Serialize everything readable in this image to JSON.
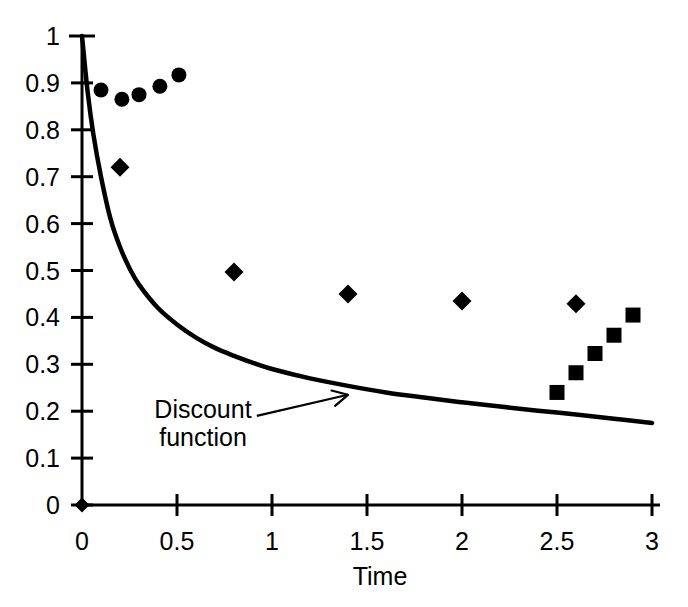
{
  "chart_data": {
    "type": "scatter",
    "title": "",
    "subtitle": "",
    "xlabel": "Time",
    "ylabel": "",
    "xlim": [
      0,
      3
    ],
    "ylim": [
      0,
      1
    ],
    "grid": false,
    "legend_position": "none",
    "x_ticks": [
      0,
      0.5,
      1,
      1.5,
      2,
      2.5,
      3
    ],
    "x_tick_labels": [
      "0",
      "0.5",
      "1",
      "1.5",
      "2",
      "2.5",
      "3"
    ],
    "y_ticks": [
      0,
      0.1,
      0.2,
      0.3,
      0.4,
      0.5,
      0.6,
      0.7,
      0.8,
      0.9,
      1
    ],
    "y_tick_labels": [
      "0",
      "0.1",
      "0.2",
      "0.3",
      "0.4",
      "0.5",
      "0.6",
      "0.7",
      "0.8",
      "0.9",
      "1"
    ],
    "annotations": [
      {
        "text_line1": "Discount",
        "text_line2": "function",
        "text": "Discount function",
        "arrow_from": [
          0.92,
          0.19
        ],
        "arrow_to": [
          1.4,
          0.235
        ]
      }
    ],
    "series": [
      {
        "name": "discount-curve",
        "marker": "line",
        "type": "line",
        "x": [
          0.0,
          0.03,
          0.06,
          0.1,
          0.15,
          0.2,
          0.25,
          0.3,
          0.4,
          0.5,
          0.6,
          0.7,
          0.8,
          0.9,
          1.0,
          1.2,
          1.4,
          1.6,
          1.8,
          2.0,
          2.2,
          2.4,
          2.6,
          2.8,
          3.0
        ],
        "y": [
          1.0,
          0.88,
          0.79,
          0.7,
          0.61,
          0.55,
          0.505,
          0.47,
          0.42,
          0.385,
          0.357,
          0.335,
          0.318,
          0.303,
          0.29,
          0.27,
          0.254,
          0.24,
          0.229,
          0.219,
          0.21,
          0.201,
          0.193,
          0.184,
          0.175
        ]
      },
      {
        "name": "circles",
        "marker": "circle",
        "type": "scatter",
        "x": [
          0.1,
          0.21,
          0.3,
          0.41,
          0.51
        ],
        "y": [
          0.885,
          0.865,
          0.875,
          0.893,
          0.917
        ]
      },
      {
        "name": "diamonds",
        "marker": "diamond",
        "type": "scatter",
        "x": [
          0.2,
          0.8,
          1.4,
          2.0,
          2.6
        ],
        "y": [
          0.72,
          0.497,
          0.45,
          0.435,
          0.429
        ]
      },
      {
        "name": "squares",
        "marker": "square",
        "type": "scatter",
        "x": [
          2.5,
          2.6,
          2.7,
          2.8,
          2.9
        ],
        "y": [
          0.24,
          0.282,
          0.323,
          0.362,
          0.405
        ]
      },
      {
        "name": "origin-point",
        "marker": "diamond",
        "type": "scatter",
        "x": [
          0.0
        ],
        "y": [
          0.0
        ]
      }
    ]
  },
  "geometry": {
    "origin_px": [
      82,
      505
    ],
    "x_axis_end_px": [
      660,
      505
    ],
    "y_axis_top_px": [
      82,
      36
    ],
    "px_per_x_unit": 190,
    "px_per_y_unit": 469
  },
  "colors": {
    "ink": "#000000",
    "background": "#ffffff"
  }
}
